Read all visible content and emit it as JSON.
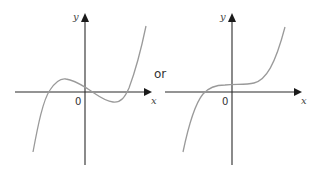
{
  "figure": {
    "separator_text": "or",
    "graphs": [
      {
        "id": "left",
        "description": "cubic with a local maximum and minimum, three real roots",
        "x_label": "x",
        "y_label": "y",
        "origin_label": "0",
        "curve_color": "#9a9a9a",
        "axis_color": "#2b2b2b"
      },
      {
        "id": "right",
        "description": "cubic with a flat (inflection) region, one real root",
        "x_label": "x",
        "y_label": "y",
        "origin_label": "0",
        "curve_color": "#9a9a9a",
        "axis_color": "#2b2b2b"
      }
    ]
  }
}
